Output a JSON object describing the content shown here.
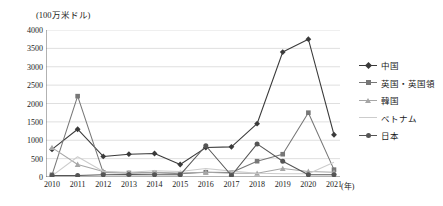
{
  "chart_data": {
    "type": "line",
    "title": "",
    "unit_label": "(100万米ドル)",
    "xlabel": "(年)",
    "ylabel": "",
    "x": [
      "2010",
      "2011",
      "2012",
      "2013",
      "2014",
      "2015",
      "2016",
      "2017",
      "2018",
      "2019",
      "2020",
      "2021"
    ],
    "ylim": [
      0,
      4000
    ],
    "yticks": [
      "0",
      "500",
      "1000",
      "1500",
      "2000",
      "2500",
      "3000",
      "3500",
      "4000"
    ],
    "ytick_values": [
      0,
      500,
      1000,
      1500,
      2000,
      2500,
      3000,
      3500,
      4000
    ],
    "grid": true,
    "legend_position": "right",
    "series": [
      {
        "name": "中国",
        "marker": "diamond",
        "color": "#3a3a3a",
        "values": [
          750,
          1300,
          560,
          620,
          640,
          340,
          800,
          820,
          1450,
          3400,
          3750,
          1150
        ]
      },
      {
        "name": "英国・英国領",
        "marker": "square",
        "color": "#777777",
        "values": [
          60,
          2200,
          120,
          110,
          120,
          90,
          130,
          120,
          430,
          620,
          1750,
          200
        ]
      },
      {
        "name": "韓国",
        "marker": "triangle",
        "color": "#a6a6a6",
        "values": [
          800,
          340,
          150,
          110,
          120,
          110,
          130,
          100,
          100,
          230,
          150,
          130
        ]
      },
      {
        "name": "ベトナム",
        "marker": "none",
        "color": "#cccccc",
        "values": [
          30,
          550,
          150,
          130,
          170,
          150,
          230,
          160,
          100,
          90,
          90,
          400
        ]
      },
      {
        "name": "日本",
        "marker": "circle",
        "color": "#555555",
        "values": [
          40,
          40,
          60,
          70,
          60,
          60,
          850,
          40,
          900,
          430,
          60,
          60
        ]
      }
    ]
  }
}
